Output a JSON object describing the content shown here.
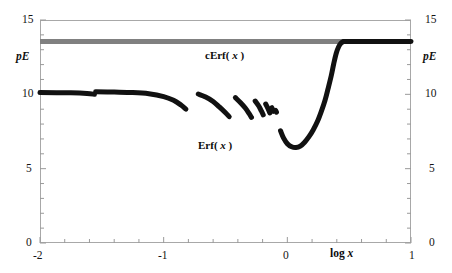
{
  "chart_data": {
    "type": "line",
    "title": "",
    "subtitle": "",
    "xlabel": "log x",
    "ylabel": "pE",
    "ylabel_right": "pE",
    "xlim": [
      -2,
      1
    ],
    "ylim": [
      0,
      15
    ],
    "grid": false,
    "legend_position": "inline-annotation",
    "x_major_ticks": [
      -2,
      -1,
      0,
      1
    ],
    "x_tick_labels": [
      "-2",
      "-1",
      "0",
      "1"
    ],
    "x_minor_tick_step": 0.2,
    "y_major_ticks": [
      0,
      5,
      10,
      15
    ],
    "y_tick_labels": [
      "0",
      "5",
      "10",
      "15"
    ],
    "y_minor_tick_step": 1,
    "series": [
      {
        "name": "cErf(x)",
        "label_html": "cErf( x )",
        "color": "#808080",
        "style": "thick-horizontal-line",
        "width_px": 5,
        "constant_value": 13.55,
        "x_start": -2,
        "x_end": 0.45,
        "annotation": {
          "text": "cErf( x )",
          "x": -0.47,
          "y": 12.1
        }
      },
      {
        "name": "Erf(x)",
        "label_html": "Erf( x )",
        "color": "#111111",
        "style": "thick-broken-curve",
        "width_px": 5,
        "annotation": {
          "text": "Erf( x )",
          "x": -0.52,
          "y": 5.55
        },
        "segments": [
          {
            "comment": "flat plateau near pE 10.1 then small step down",
            "points": [
              [
                -2.0,
                10.12
              ],
              [
                -1.75,
                10.1
              ],
              [
                -1.62,
                10.06
              ],
              [
                -1.56,
                10.0
              ]
            ]
          },
          {
            "comment": "second plateau slightly higher then gentle decline",
            "points": [
              [
                -1.55,
                10.17
              ],
              [
                -1.4,
                10.15
              ],
              [
                -1.25,
                10.12
              ],
              [
                -1.12,
                10.04
              ],
              [
                -1.0,
                9.85
              ],
              [
                -0.92,
                9.6
              ],
              [
                -0.86,
                9.28
              ],
              [
                -0.82,
                9.0
              ]
            ]
          },
          {
            "comment": "third descending arc",
            "points": [
              [
                -0.72,
                10.02
              ],
              [
                -0.66,
                9.82
              ],
              [
                -0.6,
                9.52
              ],
              [
                -0.55,
                9.15
              ],
              [
                -0.5,
                8.76
              ],
              [
                -0.47,
                8.5
              ]
            ]
          },
          {
            "comment": "fourth descending arc",
            "points": [
              [
                -0.42,
                9.78
              ],
              [
                -0.38,
                9.45
              ],
              [
                -0.34,
                9.08
              ],
              [
                -0.31,
                8.72
              ],
              [
                -0.29,
                8.45
              ]
            ]
          },
          {
            "comment": "fifth short arc",
            "points": [
              [
                -0.26,
                9.55
              ],
              [
                -0.23,
                9.2
              ],
              [
                -0.21,
                8.88
              ],
              [
                -0.195,
                8.62
              ]
            ]
          },
          {
            "comment": "sixth short arc",
            "points": [
              [
                -0.175,
                9.35
              ],
              [
                -0.155,
                9.02
              ],
              [
                -0.142,
                8.75
              ]
            ]
          },
          {
            "comment": "seventh tick",
            "points": [
              [
                -0.125,
                9.1
              ],
              [
                -0.112,
                8.86
              ]
            ]
          },
          {
            "comment": "eighth dot",
            "points": [
              [
                -0.095,
                8.92
              ],
              [
                -0.088,
                8.8
              ]
            ]
          },
          {
            "comment": "main branch: dip to minimum then steep rise to plateau",
            "points": [
              [
                -0.055,
                7.55
              ],
              [
                -0.03,
                7.05
              ],
              [
                0.0,
                6.68
              ],
              [
                0.035,
                6.47
              ],
              [
                0.07,
                6.42
              ],
              [
                0.105,
                6.52
              ],
              [
                0.14,
                6.78
              ],
              [
                0.175,
                7.15
              ],
              [
                0.21,
                7.62
              ],
              [
                0.245,
                8.2
              ],
              [
                0.275,
                8.85
              ],
              [
                0.305,
                9.6
              ],
              [
                0.33,
                10.4
              ],
              [
                0.355,
                11.25
              ],
              [
                0.375,
                12.05
              ],
              [
                0.395,
                12.75
              ],
              [
                0.415,
                13.2
              ],
              [
                0.435,
                13.45
              ],
              [
                0.455,
                13.55
              ]
            ]
          },
          {
            "comment": "final flat plateau to right edge",
            "points": [
              [
                0.455,
                13.55
              ],
              [
                0.7,
                13.56
              ],
              [
                1.0,
                13.56
              ]
            ]
          }
        ]
      }
    ]
  }
}
